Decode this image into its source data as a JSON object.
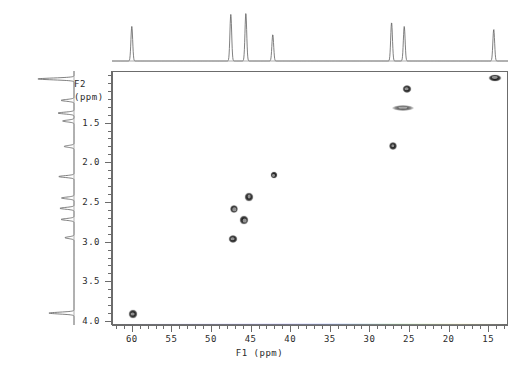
{
  "figure": {
    "kind": "2d-nmr-correlation-spectrum",
    "background_color": "#ffffff",
    "frame_color": "#6c6c6c",
    "peak_color": "#111111"
  },
  "axes": {
    "x": {
      "label": "F1  (ppm)",
      "name": "F1",
      "unit": "ppm",
      "reversed": true,
      "range": [
        62.5,
        12.5
      ],
      "major_ticks": [
        60,
        55,
        50,
        45,
        40,
        35,
        30,
        25,
        20,
        15
      ],
      "tick_labels": [
        "60",
        "55",
        "50",
        "45",
        "40",
        "35",
        "30",
        "25",
        "20",
        "15"
      ],
      "minor_tick_step": 1
    },
    "y": {
      "label": "F2",
      "unit": "(ppm)",
      "name": "F2",
      "reversed": true,
      "range": [
        0.85,
        4.05
      ],
      "major_ticks": [
        1.5,
        2.0,
        2.5,
        3.0,
        3.5,
        4.0
      ],
      "tick_labels": [
        "1.5",
        "2.0",
        "2.5",
        "3.0",
        "3.5",
        "4.0"
      ],
      "minor_tick_step": 0.1
    }
  },
  "chart_data": {
    "type": "scatter",
    "title": "",
    "xlabel": "F1  (ppm)",
    "ylabel": "F2 (ppm)",
    "xlim": [
      62.5,
      12.5
    ],
    "ylim": [
      0.85,
      4.05
    ],
    "grid": false,
    "legend": "none",
    "series": [
      {
        "name": "cross-peaks",
        "points": [
          {
            "id": "p1",
            "x": 14.3,
            "y": 0.92,
            "w": 13,
            "h": 7,
            "label": "CH3 / H 0.92"
          },
          {
            "id": "p2",
            "x": 25.4,
            "y": 1.06,
            "w": 9,
            "h": 8,
            "label": "CH2 / H 1.06"
          },
          {
            "id": "p3",
            "x": 25.9,
            "y": 1.3,
            "w": 22,
            "h": 6,
            "label": "CH2 / H 1.30 (streak)"
          },
          {
            "id": "p4",
            "x": 27.2,
            "y": 1.78,
            "w": 8,
            "h": 8,
            "label": "CH2 / H 1.78"
          },
          {
            "id": "p5",
            "x": 42.2,
            "y": 2.15,
            "w": 7,
            "h": 7,
            "label": "CH / H 2.15"
          },
          {
            "id": "p6",
            "x": 45.3,
            "y": 2.42,
            "w": 9,
            "h": 9,
            "label": "CH / H 2.42"
          },
          {
            "id": "p7",
            "x": 47.2,
            "y": 2.58,
            "w": 8,
            "h": 8,
            "label": "CH / H 2.58"
          },
          {
            "id": "p8",
            "x": 45.9,
            "y": 2.72,
            "w": 9,
            "h": 9,
            "label": "CH2 / H 2.72"
          },
          {
            "id": "p9",
            "x": 47.4,
            "y": 2.95,
            "w": 9,
            "h": 8,
            "label": "CH2 / H 2.95"
          },
          {
            "id": "p10",
            "x": 60.0,
            "y": 3.9,
            "w": 9,
            "h": 9,
            "label": "CH / H 3.90"
          }
        ]
      }
    ]
  },
  "projections": {
    "top": {
      "name": "f1-projection",
      "axis": "F1",
      "peaks": [
        {
          "x": 60.0,
          "height": 0.72
        },
        {
          "x": 47.5,
          "height": 0.97
        },
        {
          "x": 45.6,
          "height": 0.99
        },
        {
          "x": 42.2,
          "height": 0.55
        },
        {
          "x": 27.2,
          "height": 0.8
        },
        {
          "x": 25.6,
          "height": 0.72
        },
        {
          "x": 14.3,
          "height": 0.66
        }
      ]
    },
    "left": {
      "name": "f2-projection",
      "axis": "F2",
      "peaks": [
        {
          "y": 0.95,
          "height": 0.95
        },
        {
          "y": 1.22,
          "height": 0.34
        },
        {
          "y": 1.38,
          "height": 0.42
        },
        {
          "y": 1.48,
          "height": 0.3
        },
        {
          "y": 1.8,
          "height": 0.26
        },
        {
          "y": 2.18,
          "height": 0.4
        },
        {
          "y": 2.45,
          "height": 0.33
        },
        {
          "y": 2.58,
          "height": 0.37
        },
        {
          "y": 2.72,
          "height": 0.34
        },
        {
          "y": 2.95,
          "height": 0.24
        },
        {
          "y": 3.9,
          "height": 0.66
        }
      ]
    }
  }
}
